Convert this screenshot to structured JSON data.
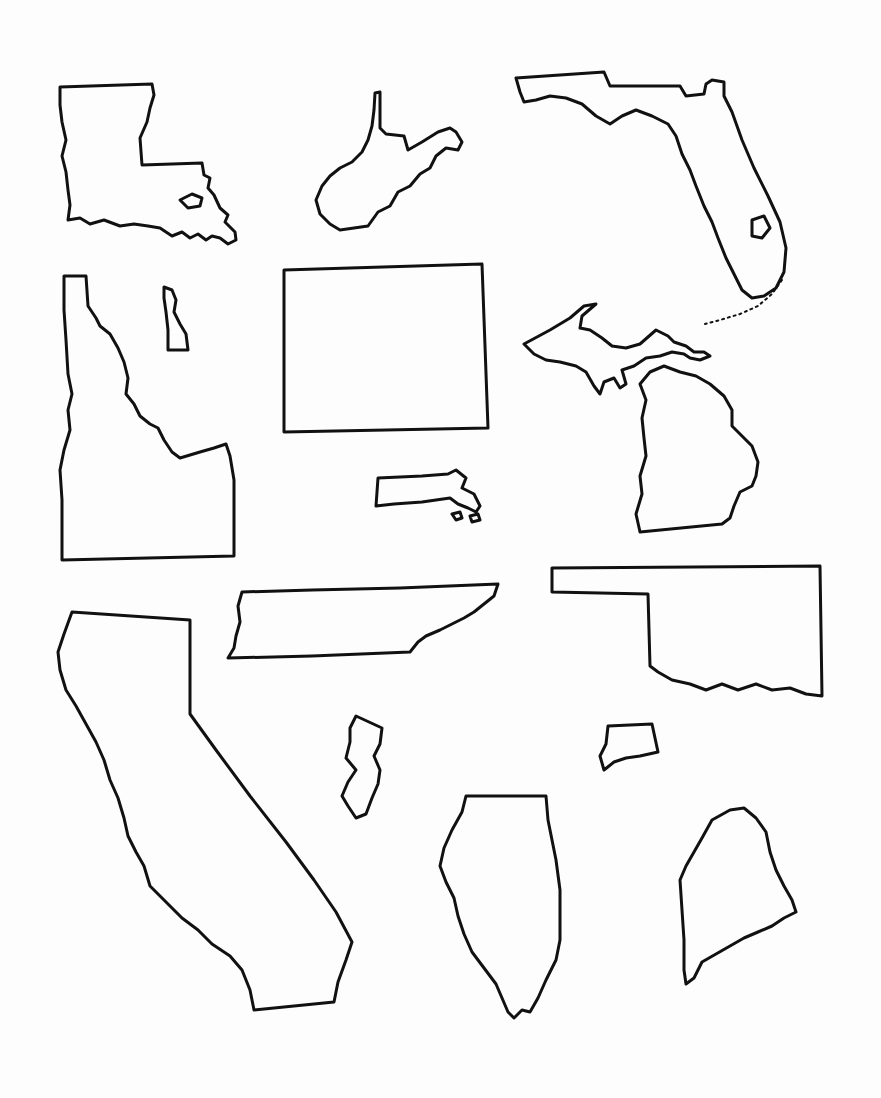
{
  "worksheet": {
    "type": "outline map worksheet",
    "background": "#ffffff",
    "stroke_color": "#111111",
    "labels_visible": false,
    "shapes": [
      {
        "state": "Louisiana",
        "position": "top-left"
      },
      {
        "state": "West Virginia",
        "position": "top-center"
      },
      {
        "state": "Florida",
        "position": "top-right"
      },
      {
        "state": "Idaho",
        "position": "upper-left"
      },
      {
        "state": "Delaware",
        "position": "upper-left-center"
      },
      {
        "state": "Colorado",
        "position": "upper-center"
      },
      {
        "state": "Michigan",
        "position": "upper-right"
      },
      {
        "state": "Massachusetts",
        "position": "center"
      },
      {
        "state": "Tennessee",
        "position": "middle-center"
      },
      {
        "state": "Oklahoma",
        "position": "middle-right"
      },
      {
        "state": "California",
        "position": "lower-left"
      },
      {
        "state": "New Jersey",
        "position": "lower-center-left"
      },
      {
        "state": "Connecticut",
        "position": "lower-center-right"
      },
      {
        "state": "Illinois",
        "position": "bottom-center"
      },
      {
        "state": "Maine",
        "position": "bottom-right"
      }
    ]
  }
}
